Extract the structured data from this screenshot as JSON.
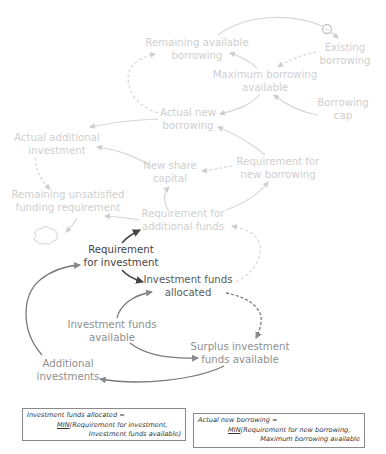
{
  "colors": {
    "faded_text": "#cfcfcf",
    "faded_line": "#d6d6d6",
    "mid_text": "#8f8f8f",
    "mid_line": "#8a8a8a",
    "dark_text": "#444444",
    "dark_line": "#555555",
    "box_border": "#8a8a8a"
  },
  "nodes": {
    "remaining_available_borrowing": {
      "line1": "Remaining  available",
      "line2": "borrowing"
    },
    "existing_borrowing": {
      "line1": "Existing",
      "line2": "borrowing"
    },
    "maximum_borrowing_available": {
      "line1": "Maximum borrowing",
      "line2": "available"
    },
    "borrowing_cap": {
      "line1": "Borrowing",
      "line2": "cap"
    },
    "actual_new_borrowing": {
      "line1": "Actual new",
      "line2": "borrowing"
    },
    "actual_additional_investment": {
      "line1": "Actual additional",
      "line2": "investment"
    },
    "new_share_capital": {
      "line1": "New share",
      "line2": "capital"
    },
    "requirement_for_new_borrowing": {
      "line1": "Requirement for",
      "line2": "new borrowing"
    },
    "remaining_unsatisfied_funding_requirement": {
      "line1": "Remaining unsatisfied",
      "line2": "funding requirement"
    },
    "requirement_for_additional_funds": {
      "line1": "Requirement for",
      "line2": "additional funds"
    },
    "requirement_for_investment": {
      "line1": "Requirement",
      "line2": "for investment"
    },
    "investment_funds_allocated": {
      "line1": "Investment funds",
      "line2": "allocated"
    },
    "investment_funds_available": {
      "line1": "Investment funds",
      "line2": "available"
    },
    "surplus_investment_funds_available": {
      "line1": "Surplus investment",
      "line2": "funds available"
    },
    "additional_investments": {
      "line1": "Additional",
      "line2": "investments"
    }
  },
  "symbols": {
    "delay_valve": "valve-icon",
    "cloud": "cloud-icon"
  },
  "equations": [
    {
      "lhs": "Investment funds allocated =",
      "fn": "MIN",
      "arg1": "(Requirement for investment,",
      "arg2": "Investment funds available)"
    },
    {
      "lhs": "Actual new borrowing =",
      "fn": "MIN",
      "arg1": "(Requirement for new borrowing,",
      "arg2": "Maximum borrowing available"
    }
  ]
}
